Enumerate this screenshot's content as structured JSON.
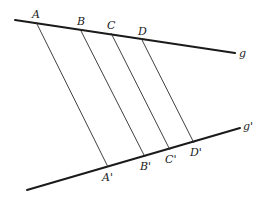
{
  "diagram": {
    "type": "parallel-projection",
    "lines": {
      "g": {
        "label": "g",
        "x1": 15,
        "y1": 20,
        "x2": 235,
        "y2": 53,
        "label_x": 239,
        "label_y": 57
      },
      "g_prime": {
        "label": "g'",
        "x1": 27,
        "y1": 190,
        "x2": 240,
        "y2": 128,
        "label_x": 243,
        "label_y": 130
      }
    },
    "points_top": [
      {
        "label": "A",
        "x": 36,
        "y": 22,
        "label_x": 32,
        "label_y": 18
      },
      {
        "label": "B",
        "x": 80,
        "y": 29,
        "label_x": 77,
        "label_y": 25
      },
      {
        "label": "C",
        "x": 111,
        "y": 33,
        "label_x": 107,
        "label_y": 29
      },
      {
        "label": "D",
        "x": 141,
        "y": 38,
        "label_x": 138,
        "label_y": 35
      }
    ],
    "points_bottom": [
      {
        "label": "A'",
        "x": 108,
        "y": 167,
        "label_x": 102,
        "label_y": 181
      },
      {
        "label": "B'",
        "x": 145,
        "y": 157,
        "label_x": 140,
        "label_y": 170
      },
      {
        "label": "C'",
        "x": 170,
        "y": 150,
        "label_x": 165,
        "label_y": 163
      },
      {
        "label": "D'",
        "x": 194,
        "y": 143,
        "label_x": 190,
        "label_y": 156
      }
    ],
    "colors": {
      "stroke": "#1a1a1a",
      "background": "#ffffff"
    }
  }
}
